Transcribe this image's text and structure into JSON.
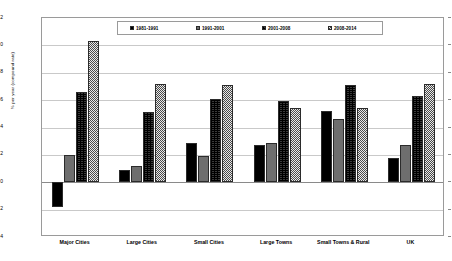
{
  "chart_data": {
    "type": "bar",
    "title": "",
    "xlabel": "",
    "ylabel": "% per year (compound rate)",
    "ylim": [
      -0.4,
      1.2
    ],
    "ytick_step": 0.2,
    "yticks": [
      "1.2",
      "1.0",
      "0.8",
      "0.6",
      "0.4",
      "0.2",
      "0.0",
      "-0.2",
      "-0.4"
    ],
    "grid": true,
    "legend_position": "top-center",
    "categories": [
      "Major Cities",
      "Large Cities",
      "Small Cities",
      "Large Towns",
      "Small Towns & Rural",
      "UK"
    ],
    "series": [
      {
        "name": "1981-1991",
        "swatch": "#000000",
        "values": [
          -0.18,
          0.09,
          0.29,
          0.27,
          0.52,
          0.18
        ]
      },
      {
        "name": "1991-2001",
        "swatch": "#6e6e6e",
        "values": [
          0.2,
          0.12,
          0.19,
          0.29,
          0.46,
          0.27
        ]
      },
      {
        "name": "2001-2008",
        "swatch": "#3a3a3a",
        "values": [
          0.66,
          0.51,
          0.61,
          0.59,
          0.71,
          0.63
        ]
      },
      {
        "name": "2008-2014",
        "swatch": "#b0b0b0",
        "values": [
          1.03,
          0.72,
          0.71,
          0.54,
          0.54,
          0.72
        ]
      }
    ]
  }
}
